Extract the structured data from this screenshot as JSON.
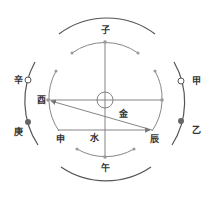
{
  "diagram": {
    "center_label": "",
    "branches": {
      "top": "子",
      "bottom": "午",
      "left": "酉",
      "lower_left": "申",
      "lower_right": "辰"
    },
    "stems": {
      "left_upper": "辛",
      "left_lower": "庚",
      "right_upper": "甲",
      "right_lower": "乙"
    },
    "elements": {
      "metal": "金",
      "water": "水"
    },
    "colors": {
      "outer_arc": "#555555",
      "inner_arc": "#888888",
      "line": "#777777",
      "text": "#333333"
    }
  }
}
